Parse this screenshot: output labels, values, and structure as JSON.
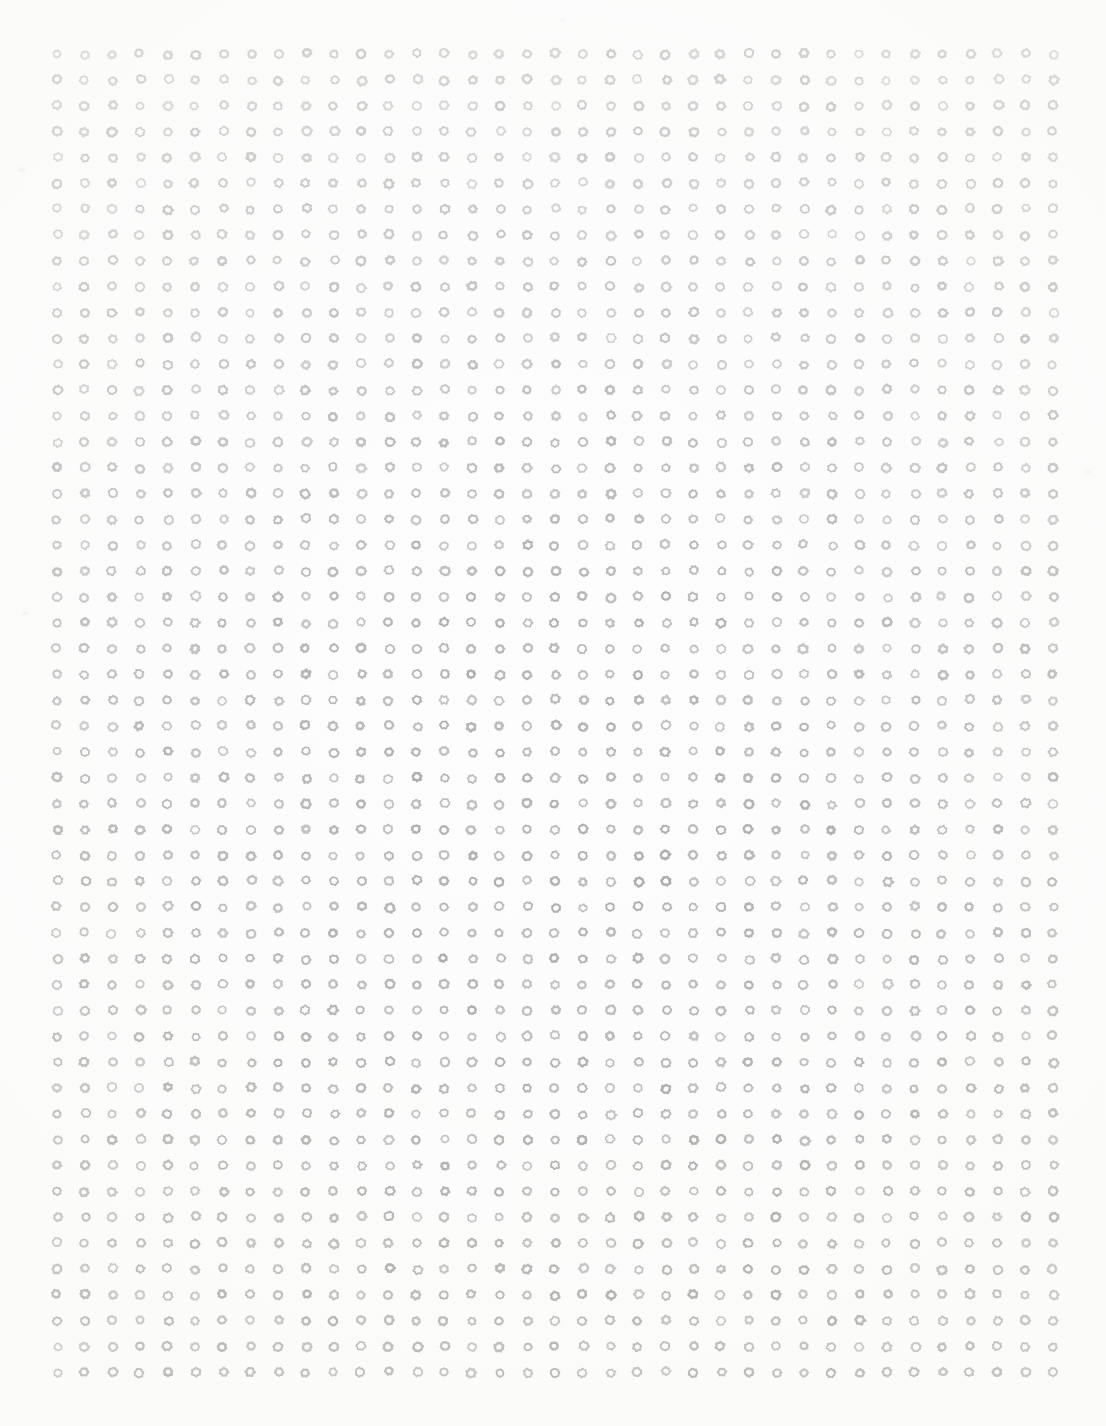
{
  "page": {
    "width": 1106,
    "height": 1426,
    "background_color": "#fdfdfd"
  },
  "grid": {
    "columns": 37,
    "rows": 52,
    "origin_x": 57,
    "origin_y": 54,
    "column_pitch": 27.67,
    "row_pitch": 25.85,
    "glyph_character": "o",
    "glyph_name": "ring-glyph",
    "glyph_outer_diameter": 11,
    "glyph_inner_diameter": 4.5
  },
  "appearance": {
    "ink_color_top": "#bcbcbc",
    "ink_color_bottom": "#909090",
    "background_color": "#fdfdfd",
    "margin_left": 48,
    "margin_right": 38,
    "margin_top": 42,
    "margin_bottom": 36
  },
  "smudges": [
    {
      "x": 18,
      "y": 168,
      "w": 7,
      "h": 4,
      "opacity": 0.45
    },
    {
      "x": 22,
      "y": 612,
      "w": 6,
      "h": 3,
      "opacity": 0.4
    },
    {
      "x": 1086,
      "y": 470,
      "w": 5,
      "h": 4,
      "opacity": 0.35
    },
    {
      "x": 560,
      "y": 18,
      "w": 5,
      "h": 3,
      "opacity": 0.3
    }
  ],
  "chart_data": {
    "type": "heatmap",
    "xlabel": "",
    "ylabel": "",
    "categories": [],
    "columns": 37,
    "rows": 52,
    "cell_value": 1
  }
}
